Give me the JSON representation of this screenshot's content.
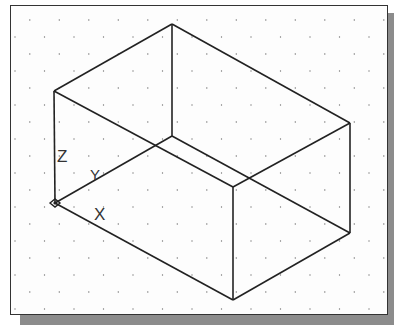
{
  "viewport": {
    "title": "Isometric box wireframe with UCS icon",
    "grid": {
      "type": "isometric-dot",
      "spacing_x": 29.5,
      "spacing_y": 17,
      "color": "#777777"
    },
    "line_color": "#222222"
  },
  "ucs_icon": {
    "labels": {
      "z": "Z",
      "y": "Y",
      "x": "X"
    }
  },
  "box": {
    "vertices": {
      "top_back": [
        172,
        24
      ],
      "top_left": [
        54,
        91
      ],
      "top_right": [
        350,
        123
      ],
      "top_front": [
        233,
        187
      ],
      "bottom_left": [
        55,
        203
      ],
      "bottom_back": [
        172,
        136
      ],
      "bottom_right": [
        350,
        233
      ],
      "bottom_front": [
        233,
        300
      ]
    }
  }
}
